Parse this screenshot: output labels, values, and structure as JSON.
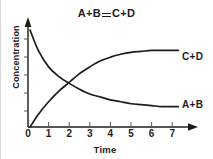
{
  "figure": {
    "title_left": "A+B",
    "title_symbol": "equilibrium-double-line",
    "title_right": "C+D",
    "background_color": "#ffffff",
    "ink_color": "#1c1c1c"
  },
  "chart_data": {
    "type": "line",
    "xlabel": "Time",
    "ylabel": "Concentration",
    "xlim": [
      0,
      7.6
    ],
    "ylim": [
      0,
      1.0
    ],
    "grid": false,
    "legend": "inline-right-of-curves",
    "xticks": [
      0,
      1,
      2,
      3,
      4,
      5,
      6,
      7
    ],
    "xtick_labels": [
      "0",
      "1",
      "2",
      "3",
      "4",
      "5",
      "6",
      "7"
    ],
    "ytick_labels": [],
    "annotations": [
      "A+B",
      "C+D"
    ],
    "x": [
      0.1,
      0.5,
      1.0,
      1.5,
      2.0,
      2.5,
      3.0,
      3.5,
      4.0,
      4.5,
      5.0,
      5.5,
      6.0,
      6.5,
      7.0,
      7.3
    ],
    "series": [
      {
        "name": "A+B",
        "label": "A+B",
        "description": "reactant concentration decreasing to equilibrium plateau",
        "values": [
          1.0,
          0.79,
          0.62,
          0.52,
          0.45,
          0.39,
          0.34,
          0.31,
          0.28,
          0.26,
          0.24,
          0.23,
          0.22,
          0.21,
          0.21,
          0.21
        ]
      },
      {
        "name": "C+D",
        "label": "C+D",
        "description": "product concentration increasing to equilibrium plateau",
        "values": [
          0.0,
          0.13,
          0.26,
          0.37,
          0.46,
          0.55,
          0.62,
          0.68,
          0.72,
          0.75,
          0.77,
          0.78,
          0.79,
          0.79,
          0.79,
          0.79
        ]
      }
    ],
    "crossing_point": {
      "x": 2.0,
      "label": "curves intersect near t = 2"
    }
  },
  "axis": {
    "x_label": "Time",
    "y_label": "Concentration",
    "x_arrow": true,
    "y_arrow": true,
    "y_minor_ticks": 5
  },
  "labels": {
    "curve_top": "C+D",
    "curve_bottom": "A+B"
  }
}
